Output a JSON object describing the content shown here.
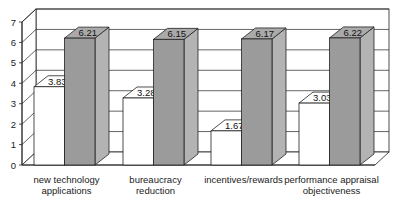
{
  "chart_data": {
    "type": "bar",
    "style": "3d-clustered-column",
    "title": "",
    "xlabel": "",
    "ylabel": "",
    "ylim": [
      0,
      7
    ],
    "yticks": [
      0,
      1,
      2,
      3,
      4,
      5,
      6,
      7
    ],
    "grid": true,
    "legend": "none",
    "categories": [
      [
        "new technology",
        "applications"
      ],
      [
        "bureaucracy",
        "reduction"
      ],
      [
        "incentives/rewards"
      ],
      [
        "performance appraisal",
        "objectiveness"
      ]
    ],
    "series": [
      {
        "name": "series-1",
        "color": "#ffffff",
        "values": [
          3.83,
          3.28,
          1.67,
          3.03
        ]
      },
      {
        "name": "series-2",
        "color": "#9c9c9c",
        "values": [
          6.21,
          6.15,
          6.17,
          6.22
        ]
      }
    ],
    "data_labels": true
  }
}
